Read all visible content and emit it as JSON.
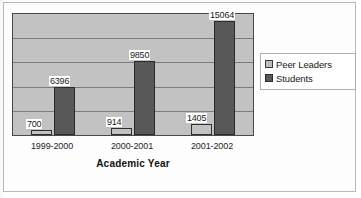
{
  "chart_data": {
    "type": "bar",
    "title": "",
    "xlabel": "Academic Year",
    "ylabel": "",
    "categories": [
      "1999-2000",
      "2000-2001",
      "2001-2002"
    ],
    "series": [
      {
        "name": "Peer Leaders",
        "values": [
          700,
          914,
          1405
        ],
        "color": "#c2c2c2"
      },
      {
        "name": "Students",
        "values": [
          6396,
          9850,
          15064
        ],
        "color": "#585858"
      }
    ],
    "ylim": [
      0,
      16000
    ],
    "gridlines": [
      3200,
      6400,
      9600,
      12800
    ],
    "grid": true,
    "y_tick_labels": [],
    "legend_position": "right",
    "data_labels": [
      "700",
      "6396",
      "914",
      "9850",
      "1405",
      "15064"
    ],
    "plot_background": "#c2c2c2"
  },
  "legend": {
    "items": [
      {
        "label": "Peer Leaders",
        "swatch": "legend-swatch-peer-leaders"
      },
      {
        "label": "Students",
        "swatch": "legend-swatch-students"
      }
    ]
  },
  "axis": {
    "title": "Academic Year"
  }
}
